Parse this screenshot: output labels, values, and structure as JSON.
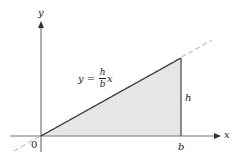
{
  "diagram": {
    "axes": {
      "x_label": "x",
      "y_label": "y",
      "origin_label": "0"
    },
    "line": {
      "equation_lhs": "y",
      "equation_eq": "=",
      "equation_numerator": "h",
      "equation_denominator": "b",
      "equation_var": "x"
    },
    "labels": {
      "height": "h",
      "base": "b"
    },
    "colors": {
      "axis": "#777777",
      "triangle_edge": "#333333",
      "fill": "#e6e6e6",
      "dashed_line": "#c8c8c8",
      "text": "#222222"
    }
  }
}
